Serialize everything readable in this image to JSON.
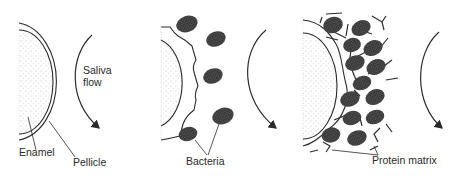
{
  "panels": [
    {
      "id": "stage-1",
      "labels": {
        "saliva_line1": "Saliva",
        "saliva_line2": "flow",
        "enamel": "Enamel",
        "pellicle": "Pellicle"
      }
    },
    {
      "id": "stage-2",
      "labels": {
        "bacteria": "Bacteria"
      }
    },
    {
      "id": "stage-3",
      "labels": {
        "protein_matrix": "Protein matrix"
      }
    }
  ],
  "colors": {
    "line": "#2a2a2a",
    "stipple": "#b8b8b8",
    "bacteria_fill": "#3a3a3a"
  }
}
